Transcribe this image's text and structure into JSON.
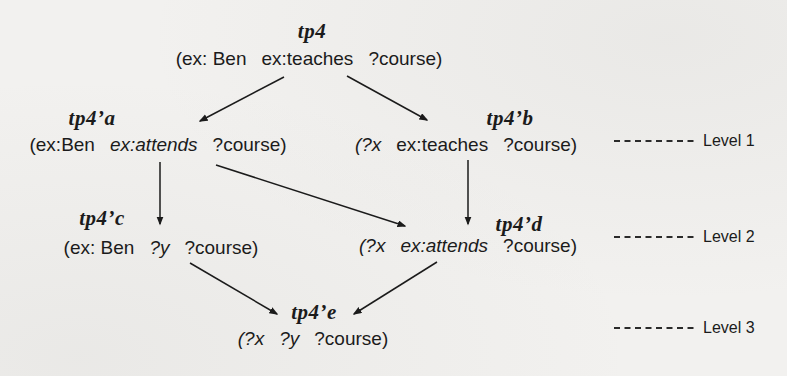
{
  "colors": {
    "ink": "#1b1b1b",
    "paper": "#f2f1ef"
  },
  "nodes": {
    "tp4": {
      "label": "tp4",
      "subject": "(ex: Ben",
      "predicate": "ex:teaches",
      "object": "?course)"
    },
    "tp4a": {
      "label": "tp4’a",
      "subject": "(ex:Ben",
      "predicate": "ex:attends",
      "object": "?course)"
    },
    "tp4b": {
      "label": "tp4’b",
      "subject": "(?x",
      "predicate": "ex:teaches",
      "object": "?course)"
    },
    "tp4c": {
      "label": "tp4’c",
      "subject": "(ex: Ben",
      "predicate": "?y",
      "object": "?course)"
    },
    "tp4d": {
      "label": "tp4’d",
      "subject": "(?x",
      "predicate": "ex:attends",
      "object": "?course)"
    },
    "tp4e": {
      "label": "tp4’e",
      "subject": "(?x",
      "predicate": "?y",
      "object": "?course)"
    }
  },
  "edges": [
    {
      "from": "tp4",
      "to": "tp4’a"
    },
    {
      "from": "tp4",
      "to": "tp4’b"
    },
    {
      "from": "tp4’a",
      "to": "tp4’c"
    },
    {
      "from": "tp4’a",
      "to": "tp4’d"
    },
    {
      "from": "tp4’b",
      "to": "tp4’d"
    },
    {
      "from": "tp4’c",
      "to": "tp4’e"
    },
    {
      "from": "tp4’d",
      "to": "tp4’e"
    }
  ],
  "levels": [
    {
      "label": "Level 1"
    },
    {
      "label": "Level 2"
    },
    {
      "label": "Level 3"
    }
  ]
}
